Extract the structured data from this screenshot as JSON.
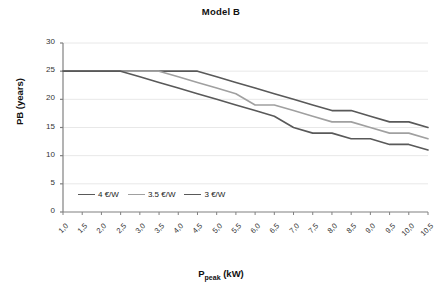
{
  "chart_data": {
    "type": "line",
    "title": "Model B",
    "xlabel": "P_peak (kW)",
    "xlabel_main": "P",
    "xlabel_sub": "peak",
    "xlabel_unit": " (kW)",
    "ylabel": "PB (years)",
    "xlim": [
      1.0,
      10.5
    ],
    "ylim": [
      0,
      30
    ],
    "yticks": [
      0,
      5,
      10,
      15,
      20,
      25,
      30
    ],
    "xticks": [
      "1,0",
      "1,5",
      "2,0",
      "2,5",
      "3,0",
      "3,5",
      "4,0",
      "4,5",
      "5,0",
      "5,5",
      "6,0",
      "6,5",
      "7,0",
      "7,5",
      "8,0",
      "8,5",
      "9,0",
      "9,5",
      "10,0",
      "10,5"
    ],
    "x": [
      1.0,
      1.5,
      2.0,
      2.5,
      3.0,
      3.5,
      4.0,
      4.5,
      5.0,
      5.5,
      6.0,
      6.5,
      7.0,
      7.5,
      8.0,
      8.5,
      9.0,
      9.5,
      10.0,
      10.5
    ],
    "grid": true,
    "legend_position": "inside-lower-left",
    "series": [
      {
        "name": "4 €/W",
        "color": "#595959",
        "values": [
          25,
          25,
          25,
          25,
          25,
          25,
          25,
          25,
          24,
          23,
          22,
          21,
          20,
          19,
          18,
          18,
          17,
          16,
          16,
          15
        ]
      },
      {
        "name": "3.5 €/W",
        "color": "#a0a0a0",
        "values": [
          25,
          25,
          25,
          25,
          25,
          25,
          24,
          23,
          22,
          21,
          19,
          19,
          18,
          17,
          16,
          16,
          15,
          14,
          14,
          13
        ]
      },
      {
        "name": "3 €/W",
        "color": "#595959",
        "values": [
          25,
          25,
          25,
          25,
          24,
          23,
          22,
          21,
          20,
          19,
          18,
          17,
          15,
          14,
          14,
          13,
          13,
          12,
          12,
          11
        ]
      }
    ]
  },
  "axis_colors": {
    "axis": "#808080",
    "grid": "#e8e8e8"
  }
}
